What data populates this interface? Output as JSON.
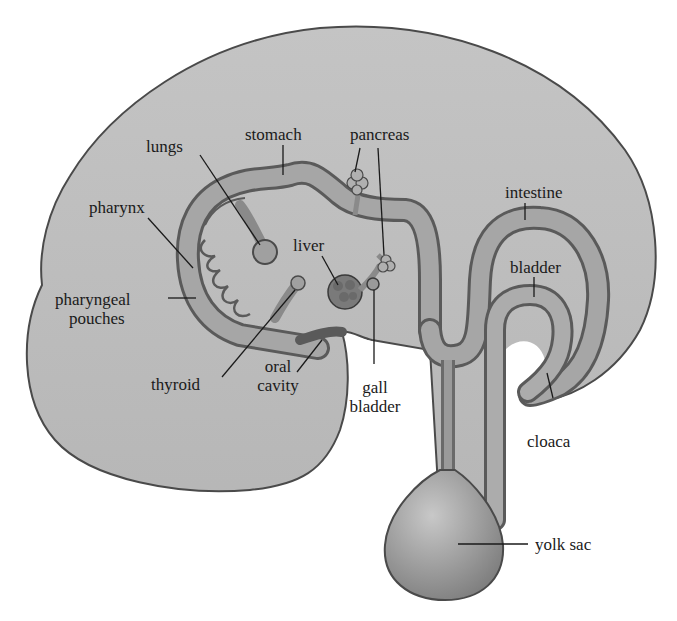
{
  "diagram": {
    "colors": {
      "body_fill": "#bdbdbd",
      "body_stroke": "#4a4a4a",
      "tube_fill": "#9a9a9a",
      "tube_inner": "#b0b0b0",
      "organ_fill": "#8a8a8a",
      "leader_line": "#1a1a1a",
      "background": "#ffffff",
      "text": "#1a1a1a"
    },
    "labels": {
      "lungs": "lungs",
      "stomach": "stomach",
      "pancreas": "pancreas",
      "pharynx": "pharynx",
      "liver": "liver",
      "intestine": "intestine",
      "bladder": "bladder",
      "pharyngeal_pouches_1": "pharyngeal",
      "pharyngeal_pouches_2": "pouches",
      "thyroid": "thyroid",
      "oral_cavity_1": "oral",
      "oral_cavity_2": "cavity",
      "gall_bladder_1": "gall",
      "gall_bladder_2": "bladder",
      "cloaca": "cloaca",
      "yolk_sac": "yolk sac"
    }
  }
}
